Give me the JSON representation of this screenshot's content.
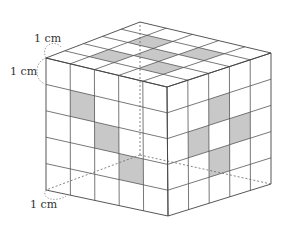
{
  "figure": {
    "grid_size": 5,
    "shade_color": "#c8c8c8",
    "line_color": "#444444",
    "labels": [
      {
        "id": "top",
        "text": "1 cm",
        "x": 34,
        "y": 42
      },
      {
        "id": "left",
        "text": "1 cm",
        "x": 10,
        "y": 75
      },
      {
        "id": "bottom",
        "text": "1 cm",
        "x": 30,
        "y": 208
      }
    ],
    "vertices": {
      "front_top_left": [
        46,
        58
      ],
      "front_top_right": [
        167,
        87
      ],
      "back_top_right": [
        271,
        53
      ],
      "back_top_left": [
        140,
        22
      ],
      "front_bottom_left": [
        46,
        190
      ],
      "front_bottom_right": [
        168,
        216
      ],
      "back_bottom_right": [
        271,
        184
      ],
      "back_bottom_left": [
        140,
        155
      ]
    },
    "shaded_cells": {
      "front": [
        [
          1,
          1
        ],
        [
          2,
          2
        ],
        [
          3,
          3
        ]
      ],
      "right": [
        [
          2,
          1
        ],
        [
          1,
          2
        ],
        [
          3,
          2
        ],
        [
          2,
          3
        ]
      ],
      "top": [
        [
          1,
          1
        ],
        [
          1,
          3
        ],
        [
          2,
          2
        ],
        [
          3,
          1
        ],
        [
          3,
          3
        ]
      ]
    }
  }
}
